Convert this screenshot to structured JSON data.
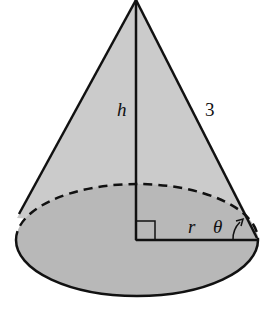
{
  "diagram": {
    "type": "right circular cone",
    "labels": {
      "height": "h",
      "slant": "3",
      "radius": "r",
      "angle": "θ"
    },
    "colors": {
      "lateral_fill": "#c9c9c9",
      "base_fill": "#b5b5b5",
      "stroke": "#111111"
    }
  }
}
